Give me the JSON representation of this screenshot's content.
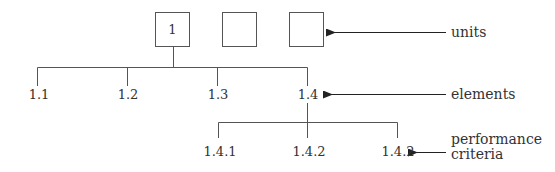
{
  "units": {
    "label": "units",
    "boxes": [
      {
        "label": "1"
      },
      {
        "label": ""
      },
      {
        "label": ""
      }
    ]
  },
  "elements": {
    "label": "elements",
    "items": [
      {
        "label": "1.1"
      },
      {
        "label": "1.2"
      },
      {
        "label": "1.3"
      },
      {
        "label": "1.4"
      }
    ]
  },
  "performance_criteria": {
    "label_line1": "performance",
    "label_line2": "criteria",
    "items": [
      {
        "label": "1.4.1"
      },
      {
        "label": "1.4.2"
      },
      {
        "label": "1.4.2"
      }
    ]
  },
  "colors": {
    "line": "#555555",
    "text": "#333333"
  }
}
